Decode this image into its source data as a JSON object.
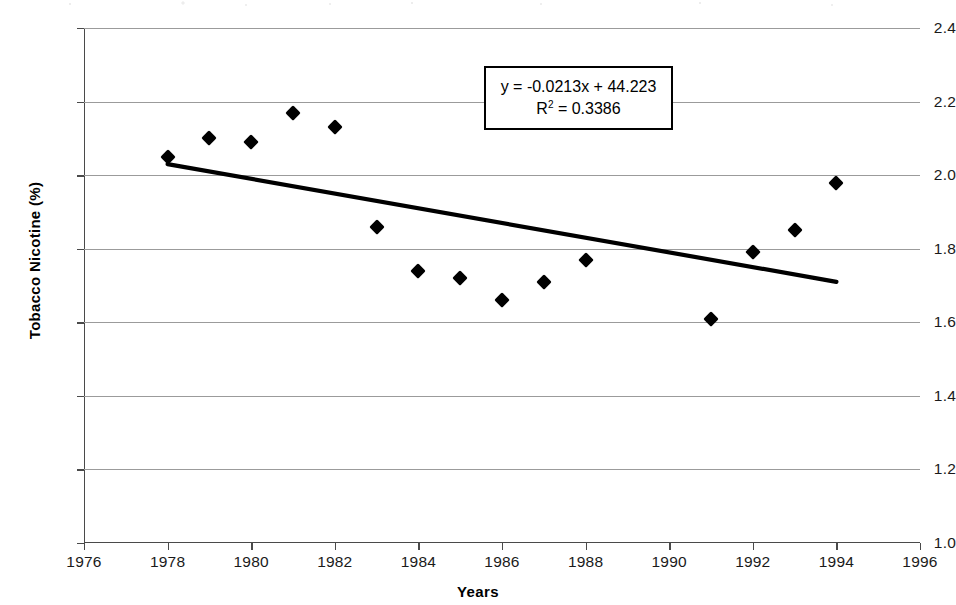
{
  "chart_data": {
    "type": "scatter",
    "title": "",
    "xlabel": "Years",
    "ylabel": "Tobacco Nicotine (%)",
    "xlim": [
      1976,
      1996
    ],
    "ylim": [
      1.0,
      2.4
    ],
    "xticks": [
      1976,
      1978,
      1980,
      1982,
      1984,
      1986,
      1988,
      1990,
      1992,
      1994,
      1996
    ],
    "yticks": [
      1.0,
      1.2,
      1.4,
      1.6,
      1.8,
      2.0,
      2.2,
      2.4
    ],
    "grid": "horizontal",
    "legend": "none",
    "marker": "filled-diamond",
    "series": [
      {
        "name": "Tobacco Nicotine (%)",
        "x": [
          1978,
          1979,
          1980,
          1981,
          1982,
          1983,
          1984,
          1985,
          1986,
          1987,
          1988,
          1991,
          1992,
          1993,
          1994
        ],
        "values": [
          2.05,
          2.1,
          2.09,
          2.17,
          2.13,
          1.86,
          1.74,
          1.72,
          1.66,
          1.71,
          1.77,
          1.61,
          1.79,
          1.85,
          1.98
        ]
      }
    ],
    "trendline": {
      "type": "linear",
      "equation": "y = -0.0213x + 44.223",
      "slope": -0.0213,
      "intercept": 44.223,
      "r_squared": 0.3386,
      "r_squared_label": "R",
      "r_squared_exponent": "2",
      "r_squared_value": "= 0.3386",
      "x_start": 1978,
      "x_end": 1994,
      "y_start": 2.03,
      "y_end": 1.71
    },
    "annotations": [
      {
        "name": "equation-box",
        "line1": "y = -0.0213x + 44.223",
        "line2_base": "R",
        "line2_sup": "2",
        "line2_rest": " = 0.3386"
      }
    ]
  },
  "axes": {
    "x_title": "Years",
    "y_title": "Tobacco Nicotine (%)",
    "x_tick_labels": [
      "1976",
      "1978",
      "1980",
      "1982",
      "1984",
      "1986",
      "1988",
      "1990",
      "1992",
      "1994",
      "1996"
    ],
    "y_tick_labels": [
      "2.4",
      "2.2",
      "2.0",
      "1.8",
      "1.6",
      "1.4",
      "1.2",
      "1.0"
    ]
  },
  "colors": {
    "marker": "#000000",
    "trendline": "#000000",
    "gridline": "#9b9b9b",
    "axis": "#4a4a4a",
    "background": "#ffffff"
  }
}
